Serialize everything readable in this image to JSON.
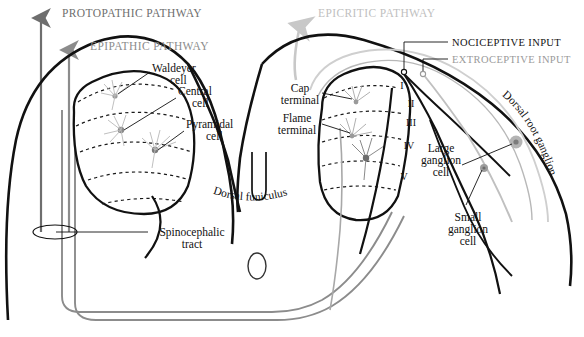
{
  "figure": {
    "width": 584,
    "height": 337,
    "background_color": "#ffffff"
  },
  "colors": {
    "outline_black": "#111111",
    "protopathic_gray": "#6e6e6e",
    "epipathic_gray": "#8c8c8c",
    "epicritic_light_gray": "#c8c8c8",
    "neuron_gray": "#b0b0b0",
    "ganglion_fill": "#a8a8a8",
    "lamina_dash": "#1a1a1a",
    "label_text": "#111111",
    "label_text_light": "#9a9a9a"
  },
  "pathways": [
    {
      "id": "protopathic",
      "label": "PROTOPATHIC PATHWAY",
      "color": "#6e6e6e",
      "arrow_x": 41,
      "label_x": 62,
      "label_y": 17,
      "font_size": 11.5
    },
    {
      "id": "epipathic",
      "label": "EPIPATHIC PATHWAY",
      "color": "#8c8c8c",
      "arrow_x": 69,
      "label_x": 90,
      "label_y": 50,
      "font_size": 11.5
    },
    {
      "id": "epicritic",
      "label": "EPICRITIC PATHWAY",
      "color": "#c8c8c8",
      "arrow_x": 300,
      "label_x": 318,
      "label_y": 17,
      "font_size": 11.5
    }
  ],
  "inputs": [
    {
      "id": "nociceptive",
      "label": "NOCICEPTIVE INPUT",
      "color": "#111111",
      "label_x": 452,
      "label_y": 45,
      "font_size": 10.5,
      "marker_x": 404,
      "marker_y": 72
    },
    {
      "id": "extroceptive",
      "label": "EXTROCEPTIVE INPUT",
      "color": "#9a9a9a",
      "label_x": 452,
      "label_y": 62,
      "font_size": 10.5,
      "marker_x": 423,
      "marker_y": 74
    }
  ],
  "cell_labels": [
    {
      "id": "waldeyer-cell",
      "lines": [
        "Waldeyer",
        "cell"
      ],
      "x": 152,
      "y": 72,
      "anchor": "start",
      "font_size": 11.5
    },
    {
      "id": "central-cell",
      "lines": [
        "Central",
        "cell"
      ],
      "x": 178,
      "y": 95,
      "anchor": "start",
      "font_size": 11.5
    },
    {
      "id": "pyramidal-cell",
      "lines": [
        "Pyramidal",
        "cell"
      ],
      "x": 186,
      "y": 128,
      "anchor": "start",
      "font_size": 11.5
    },
    {
      "id": "cap-terminal",
      "lines": [
        "Cap",
        "terminal"
      ],
      "x": 300,
      "y": 92,
      "anchor": "middle",
      "font_size": 11.5
    },
    {
      "id": "flame-terminal",
      "lines": [
        "Flame",
        "terminal"
      ],
      "x": 297,
      "y": 122,
      "anchor": "middle",
      "font_size": 11.5
    },
    {
      "id": "large-ganglion-cell",
      "lines": [
        "Large",
        "ganglion",
        "cell"
      ],
      "x": 441,
      "y": 152,
      "anchor": "middle",
      "font_size": 11.5
    },
    {
      "id": "small-ganglion-cell",
      "lines": [
        "Small",
        "ganglion",
        "cell"
      ],
      "x": 468,
      "y": 221,
      "anchor": "middle",
      "font_size": 11.5
    },
    {
      "id": "spinocephalic-tract",
      "lines": [
        "Spinocephalic",
        "tract"
      ],
      "x": 192,
      "y": 236,
      "anchor": "middle",
      "font_size": 11.5
    }
  ],
  "curved_labels": [
    {
      "id": "dorsal-funiculus",
      "text": "Dorsal funiculus",
      "font_size": 11.5
    },
    {
      "id": "dorsal-root-ganglion",
      "text": "Dorsal root ganglion",
      "font_size": 11.5
    }
  ],
  "laminae": [
    {
      "numeral": "I",
      "x": 402,
      "y": 89
    },
    {
      "numeral": "II",
      "x": 411,
      "y": 107
    },
    {
      "numeral": "III",
      "x": 411,
      "y": 126
    },
    {
      "numeral": "IV",
      "x": 409,
      "y": 149
    },
    {
      "numeral": "V",
      "x": 404,
      "y": 180
    }
  ],
  "structures": {
    "central_canal": "central-canal-ellipse",
    "median_sulcus": "dorsal-median-sulcus",
    "cord_outline": "spinal-cord-outline"
  }
}
